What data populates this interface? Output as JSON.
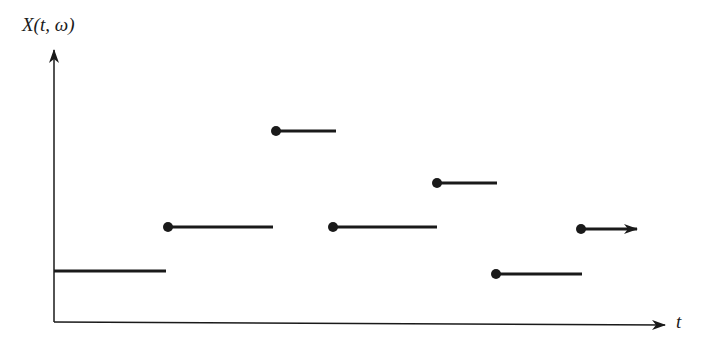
{
  "diagram": {
    "y_axis_label": "X(t, ω)",
    "x_axis_label": "t",
    "colors": {
      "ink": "#1a1a1a",
      "background": "#ffffff"
    }
  },
  "chart_data": {
    "type": "line",
    "xlabel": "t",
    "ylabel": "X(t, ω)",
    "segments": [
      {
        "x_start": 54,
        "x_end": 166,
        "y": 271,
        "start_dot": false
      },
      {
        "x_start": 168,
        "x_end": 273,
        "y": 227,
        "start_dot": true
      },
      {
        "x_start": 276,
        "x_end": 336,
        "y": 131,
        "start_dot": true
      },
      {
        "x_start": 333,
        "x_end": 437,
        "y": 227,
        "start_dot": true
      },
      {
        "x_start": 437,
        "x_end": 497,
        "y": 183,
        "start_dot": true
      },
      {
        "x_start": 496,
        "x_end": 582,
        "y": 274,
        "start_dot": true
      },
      {
        "x_start": 581,
        "x_end": 637,
        "y": 229,
        "start_dot": true,
        "arrow": true
      }
    ],
    "axes": {
      "origin": [
        54,
        322
      ],
      "y_top": 48,
      "x_right": 665
    }
  }
}
